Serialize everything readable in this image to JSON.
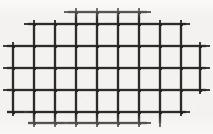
{
  "figure": {
    "kind": "mesh-grid-diagram",
    "canvas": {
      "width": 213,
      "height": 134
    },
    "style": {
      "background_color": "#f4f2f0",
      "line_color": "#2b2b2b",
      "line_color_light": "#545454",
      "bar_thickness": 2.1,
      "stub_thickness": 1.6,
      "stub_length": 4
    },
    "grid": {
      "vertical_line_x": [
        13,
        34,
        55,
        76,
        97,
        118,
        139,
        160,
        181,
        200
      ],
      "horizontal_line_y": [
        12,
        24,
        46,
        68,
        90,
        112,
        123
      ],
      "horizontal_spacing": 21,
      "vertical_spacing": 22,
      "vertical_count": 10,
      "horizontal_count": 7
    },
    "vertical_bars": [
      {
        "x": 13,
        "y1": 46,
        "y2": 112
      },
      {
        "x": 34,
        "y1": 24,
        "y2": 123
      },
      {
        "x": 55,
        "y1": 24,
        "y2": 123
      },
      {
        "x": 76,
        "y1": 12,
        "y2": 123
      },
      {
        "x": 97,
        "y1": 12,
        "y2": 123
      },
      {
        "x": 118,
        "y1": 12,
        "y2": 123
      },
      {
        "x": 139,
        "y1": 12,
        "y2": 123
      },
      {
        "x": 160,
        "y1": 24,
        "y2": 123
      },
      {
        "x": 181,
        "y1": 24,
        "y2": 112
      },
      {
        "x": 200,
        "y1": 46,
        "y2": 90
      }
    ],
    "horizontal_bars": [
      {
        "y": 12,
        "x1": 68,
        "x2": 147
      },
      {
        "y": 24,
        "x1": 28,
        "x2": 186
      },
      {
        "y": 46,
        "x1": 7,
        "x2": 206
      },
      {
        "y": 68,
        "x1": 7,
        "x2": 206
      },
      {
        "y": 90,
        "x1": 7,
        "x2": 206
      },
      {
        "y": 112,
        "x1": 7,
        "x2": 186
      },
      {
        "y": 123,
        "x1": 28,
        "x2": 147
      }
    ],
    "stubs": {
      "top": [
        {
          "x": 76,
          "y": 12
        },
        {
          "x": 97,
          "y": 12
        },
        {
          "x": 118,
          "y": 12
        },
        {
          "x": 139,
          "y": 12
        },
        {
          "x": 34,
          "y": 24
        },
        {
          "x": 55,
          "y": 24
        },
        {
          "x": 160,
          "y": 24
        },
        {
          "x": 181,
          "y": 24
        },
        {
          "x": 13,
          "y": 46
        },
        {
          "x": 200,
          "y": 46
        }
      ],
      "bottom": [
        {
          "x": 76,
          "y": 123
        },
        {
          "x": 97,
          "y": 123
        },
        {
          "x": 118,
          "y": 123
        },
        {
          "x": 34,
          "y": 123
        },
        {
          "x": 55,
          "y": 123
        },
        {
          "x": 139,
          "y": 123
        },
        {
          "x": 160,
          "y": 123
        },
        {
          "x": 181,
          "y": 112
        },
        {
          "x": 13,
          "y": 112
        },
        {
          "x": 200,
          "y": 90
        }
      ],
      "left": [
        {
          "x": 7,
          "y": 46
        },
        {
          "x": 7,
          "y": 68
        },
        {
          "x": 7,
          "y": 90
        },
        {
          "x": 28,
          "y": 24
        },
        {
          "x": 28,
          "y": 112
        },
        {
          "x": 68,
          "y": 12
        },
        {
          "x": 68,
          "y": 123
        }
      ],
      "right": [
        {
          "x": 206,
          "y": 46
        },
        {
          "x": 206,
          "y": 68
        },
        {
          "x": 206,
          "y": 90
        },
        {
          "x": 186,
          "y": 24
        },
        {
          "x": 186,
          "y": 112
        },
        {
          "x": 147,
          "y": 12
        },
        {
          "x": 147,
          "y": 123
        }
      ]
    },
    "outline": {
      "shape": "ellipse",
      "center": [
        106.5,
        67.5
      ],
      "radius_x": 96,
      "radius_y": 58,
      "approximation": "stepped staircase following grid cells"
    }
  }
}
